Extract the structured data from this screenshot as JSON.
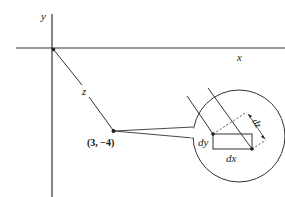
{
  "axes": {
    "x_label": "x",
    "y_label": "y"
  },
  "vector": {
    "label": "z",
    "point_label": "(3, −4)"
  },
  "inset": {
    "dx_label": "dx",
    "dy_label": "dy",
    "dz_label": "dz"
  },
  "colors": {
    "stroke": "#1a1a1a",
    "background": "#ffffff"
  }
}
